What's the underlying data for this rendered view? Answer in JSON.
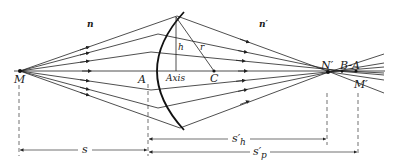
{
  "figure": {
    "type": "optics-refraction-diagram"
  },
  "labels": {
    "object_point": "M",
    "vertex": "A",
    "axis": "Axis",
    "center": "C",
    "height": "h",
    "radius": "r",
    "index_left": "n",
    "index_right": "n′",
    "marginal_image": "N′",
    "aberration": "B-A",
    "paraxial_image": "M′"
  },
  "dimensions": {
    "object_distance": "s",
    "marginal_image_distance": "s′h",
    "marginal_main": "s′",
    "marginal_sub": "h",
    "paraxial_main": "s′",
    "paraxial_sub": "p"
  },
  "colors": {
    "line": "#222222",
    "background": "#ffffff"
  }
}
